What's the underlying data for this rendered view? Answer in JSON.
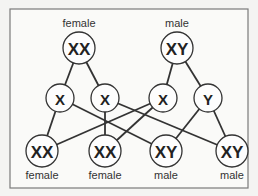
{
  "diagram": {
    "parents": [
      {
        "id": "p_female",
        "label": "female",
        "genotype": "XX"
      },
      {
        "id": "p_male",
        "label": "male",
        "genotype": "XY"
      }
    ],
    "gametes": [
      {
        "id": "g1",
        "genotype": "X",
        "from": "p_female"
      },
      {
        "id": "g2",
        "genotype": "X",
        "from": "p_female"
      },
      {
        "id": "g3",
        "genotype": "X",
        "from": "p_male"
      },
      {
        "id": "g4",
        "genotype": "Y",
        "from": "p_male"
      }
    ],
    "offspring": [
      {
        "id": "o1",
        "label": "female",
        "genotype": "XX",
        "from": [
          "g1",
          "g3"
        ]
      },
      {
        "id": "o2",
        "label": "female",
        "genotype": "XX",
        "from": [
          "g2",
          "g3"
        ]
      },
      {
        "id": "o3",
        "label": "male",
        "genotype": "XY",
        "from": [
          "g1",
          "g4"
        ]
      },
      {
        "id": "o4",
        "label": "male",
        "genotype": "XY",
        "from": [
          "g2",
          "g4"
        ]
      }
    ]
  }
}
